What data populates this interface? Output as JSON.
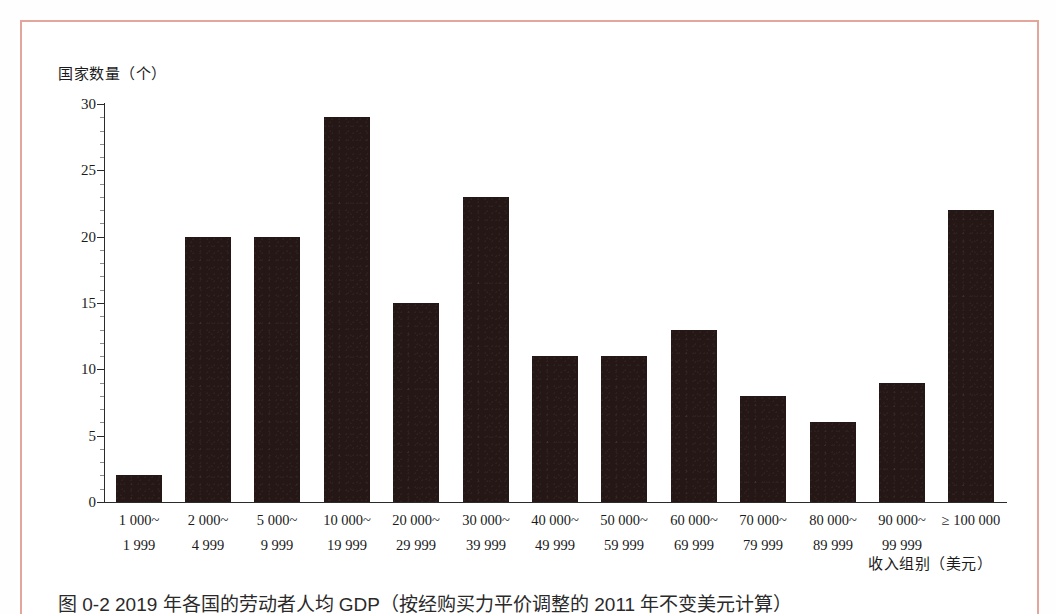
{
  "page": {
    "caption": "图 0-2  2019 年各国的劳动者人均 GDP（按经购买力平价调整的 2011 年不变美元计算）",
    "frame_color": "#e2a79a",
    "background_color": "#ffffff"
  },
  "chart_data": {
    "type": "bar",
    "title": "",
    "ylabel": "国家数量（个）",
    "xlabel": "收入组别（美元）",
    "ylim": [
      0,
      30
    ],
    "yticks": [
      0,
      5,
      10,
      15,
      20,
      25,
      30
    ],
    "ytick_labels": [
      "0",
      "5",
      "10",
      "15",
      "20",
      "25",
      "30"
    ],
    "minor_tick_step": 1,
    "grid": false,
    "legend": null,
    "bar_color": "#241715",
    "axis_color": "#2b2b2b",
    "categories": [
      "1 000~1 999",
      "2 000~4 999",
      "5 000~9 999",
      "10 000~19 999",
      "20 000~29 999",
      "30 000~39 999",
      "40 000~49 999",
      "50 000~59 999",
      "60 000~69 999",
      "70 000~79 999",
      "80 000~89 999",
      "90 000~99 999",
      "≥ 100 000"
    ],
    "category_lines": [
      {
        "l1": "1 000~",
        "l2": "1 999"
      },
      {
        "l1": "2 000~",
        "l2": "4 999"
      },
      {
        "l1": "5 000~",
        "l2": "9 999"
      },
      {
        "l1": "10 000~",
        "l2": "19 999"
      },
      {
        "l1": "20 000~",
        "l2": "29 999"
      },
      {
        "l1": "30 000~",
        "l2": "39 999"
      },
      {
        "l1": "40 000~",
        "l2": "49 999"
      },
      {
        "l1": "50 000~",
        "l2": "59 999"
      },
      {
        "l1": "60 000~",
        "l2": "69 999"
      },
      {
        "l1": "70 000~",
        "l2": "79 999"
      },
      {
        "l1": "80 000~",
        "l2": "89 999"
      },
      {
        "l1": "90 000~",
        "l2": "99 999"
      },
      {
        "l1": "≥ 100 000",
        "l2": ""
      }
    ],
    "values": [
      2,
      20,
      20,
      29,
      15,
      23,
      11,
      11,
      13,
      8,
      6,
      9,
      22
    ]
  }
}
